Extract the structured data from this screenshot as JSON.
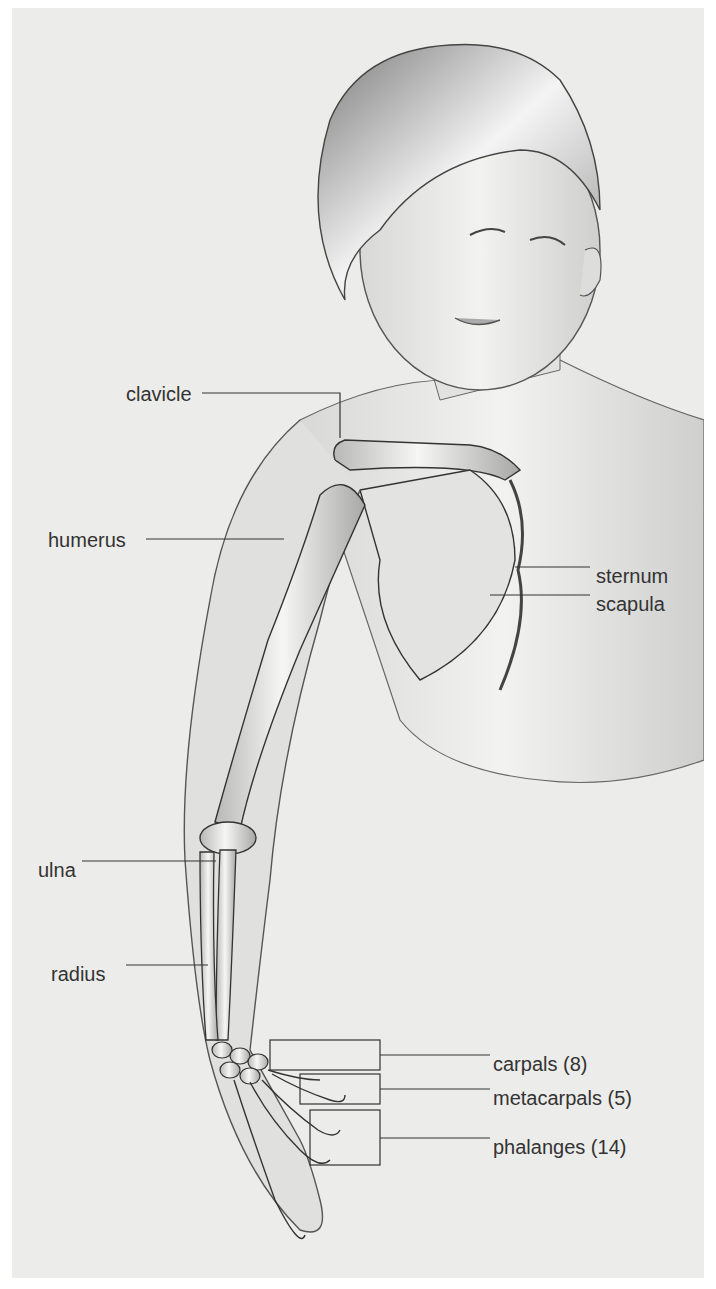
{
  "figure": {
    "labels": {
      "clavicle": "clavicle",
      "humerus": "humerus",
      "sternum": "sternum",
      "scapula": "scapula",
      "ulna": "ulna",
      "radius": "radius",
      "carpals": "carpals (8)",
      "metacarpals": "metacarpals (5)",
      "phalanges": "phalanges (14)"
    },
    "colors": {
      "background": "#ececea",
      "line": "#333333",
      "bone": "#e8e8e6",
      "skin_outline": "#555555"
    }
  }
}
